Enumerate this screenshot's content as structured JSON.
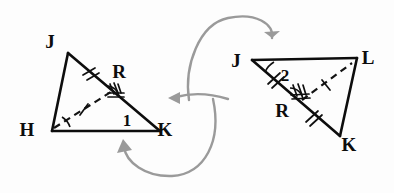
{
  "figure": {
    "background_color": "#fdfdfd",
    "ink_color": "#0d0d0d",
    "arrow_color": "#9a9a9a"
  },
  "left_triangle": {
    "name": "triangle-HJK",
    "vertices": [
      {
        "id": "J",
        "label": "J",
        "x": 68,
        "y": 53
      },
      {
        "id": "H",
        "label": "H",
        "x": 52,
        "y": 131
      },
      {
        "id": "K",
        "label": "K",
        "x": 160,
        "y": 131
      }
    ],
    "interior_point": {
      "id": "R",
      "label": "R",
      "x": 116,
      "y": 88
    },
    "angle_labels": [
      {
        "id": "1",
        "label": "1",
        "x": 128,
        "y": 122
      }
    ],
    "vertex_label_positions": {
      "J": {
        "x": 50,
        "y": 48
      },
      "H": {
        "x": 27,
        "y": 136
      },
      "K": {
        "x": 163,
        "y": 136
      },
      "R": {
        "x": 117,
        "y": 77
      }
    },
    "segments": [
      {
        "id": "JH",
        "style": "solid",
        "ticks": 0
      },
      {
        "id": "HK",
        "style": "solid",
        "ticks": 0
      },
      {
        "id": "JK",
        "style": "solid",
        "ticks": 0
      },
      {
        "id": "JR",
        "style": "solid-overlay",
        "ticks": 2
      },
      {
        "id": "HR",
        "style": "dashed",
        "ticks": 1
      }
    ],
    "angle_marks": [
      {
        "at": "H",
        "arcs": 1
      },
      {
        "at": "R",
        "arcs": 3
      }
    ]
  },
  "right_triangle": {
    "name": "triangle-JLK",
    "vertices": [
      {
        "id": "J",
        "label": "J",
        "x": 252,
        "y": 60
      },
      {
        "id": "L",
        "label": "L",
        "x": 357,
        "y": 58
      },
      {
        "id": "K",
        "label": "K",
        "x": 340,
        "y": 136
      }
    ],
    "interior_point": {
      "id": "R",
      "label": "R",
      "x": 300,
      "y": 102
    },
    "angle_labels": [
      {
        "id": "2",
        "label": "2",
        "x": 284,
        "y": 77
      }
    ],
    "vertex_label_positions": {
      "J": {
        "x": 234,
        "y": 66
      },
      "L": {
        "x": 362,
        "y": 64
      },
      "K": {
        "x": 345,
        "y": 147
      },
      "R": {
        "x": 282,
        "y": 114
      }
    },
    "segments": [
      {
        "id": "JL",
        "style": "solid",
        "ticks": 0
      },
      {
        "id": "LK",
        "style": "solid",
        "ticks": 0
      },
      {
        "id": "JK",
        "style": "solid",
        "ticks": 0
      },
      {
        "id": "JR",
        "style": "solid-overlay",
        "ticks": 2
      },
      {
        "id": "RK",
        "style": "solid-overlay",
        "ticks": 2
      },
      {
        "id": "RL",
        "style": "dashed",
        "ticks": 1
      }
    ],
    "angle_marks": [
      {
        "at": "J",
        "arcs": 1
      },
      {
        "at": "R",
        "arcs": 3
      }
    ]
  },
  "flow_arrows": [
    {
      "id": "arrow-upper",
      "description": "curved arrow looping over the top pointing right into J of the right triangle",
      "direction": "right"
    },
    {
      "id": "arrow-middle",
      "description": "curved arrow pointing left toward K of the left triangle",
      "direction": "left"
    },
    {
      "id": "arrow-lower",
      "description": "curved arrow looping under the bottom pointing up-left toward the left triangle",
      "direction": "left"
    }
  ]
}
